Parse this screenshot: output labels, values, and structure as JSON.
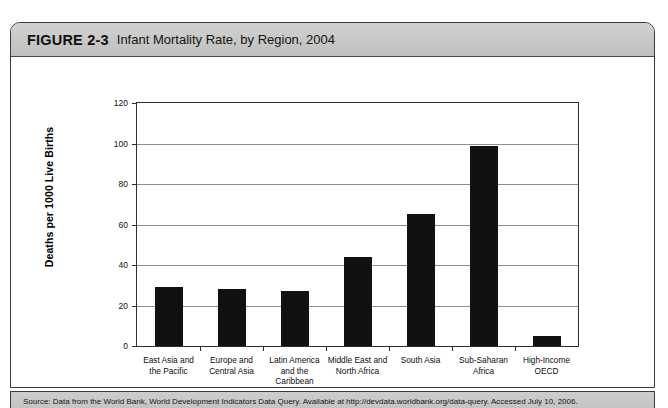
{
  "figure": {
    "label": "FIGURE 2-3",
    "title": "Infant Mortality Rate, by Region, 2004",
    "source_text": "Source: Data from the World Bank, World Development Indicators Data Query. Available at http://devdata.worldbank.org/data-query. Accessed July 10, 2006."
  },
  "chart_data": {
    "type": "bar",
    "title": "Infant Mortality Rate, by Region, 2004",
    "xlabel": "REGION/GROUP",
    "ylabel": "Deaths per 1000 Live Births",
    "ylim": [
      0,
      120
    ],
    "yticks": [
      0,
      20,
      40,
      60,
      80,
      100,
      120
    ],
    "ytick_labels": [
      "0",
      "20",
      "40",
      "60",
      "80",
      "100",
      "120"
    ],
    "grid": true,
    "legend": "none",
    "bar_color": "#111111",
    "categories": [
      "East Asia and the Pacific",
      "Europe and Central Asia",
      "Latin America and the Caribbean",
      "Middle East and North Africa",
      "South Asia",
      "Sub-Saharan Africa",
      "High-Income OECD"
    ],
    "category_lines": [
      [
        "East Asia and",
        "the Pacific"
      ],
      [
        "Europe and",
        "Central Asia"
      ],
      [
        "Latin America",
        "and the",
        "Caribbean"
      ],
      [
        "Middle East and",
        "North Africa"
      ],
      [
        "South Asia"
      ],
      [
        "Sub-Saharan",
        "Africa"
      ],
      [
        "High-Income",
        "OECD"
      ]
    ],
    "values": [
      29,
      28,
      27,
      44,
      65,
      99,
      5
    ]
  }
}
